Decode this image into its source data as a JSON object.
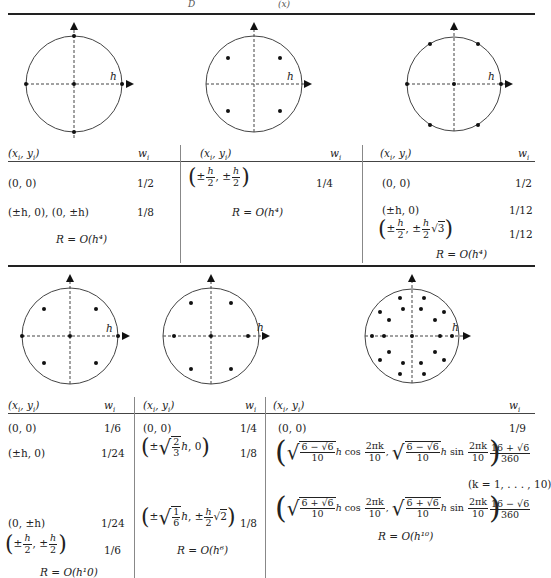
{
  "header": {
    "partial_caption": [
      "D",
      "(x)"
    ]
  },
  "labels": {
    "axis_label": "h",
    "col_xy": "(x_i, y_i)",
    "col_w": "w_i"
  },
  "top_row": {
    "panels": [
      {
        "id": "rule-5pt",
        "points": [
          [
            0,
            0
          ],
          [
            1,
            0
          ],
          [
            -1,
            0
          ],
          [
            0,
            1
          ],
          [
            0,
            -1
          ]
        ],
        "rows": [
          {
            "xy": "(0, 0)",
            "w": "1/2"
          },
          {
            "xy": "(±h, 0), (0, ±h)",
            "w": "1/8"
          }
        ],
        "error": "R = O(h⁴)"
      },
      {
        "id": "rule-4pt",
        "points": [
          [
            0.5,
            0.5
          ],
          [
            -0.5,
            0.5
          ],
          [
            0.5,
            -0.5
          ],
          [
            -0.5,
            -0.5
          ]
        ],
        "rows": [
          {
            "xy": "(±h/2, ±h/2)",
            "w": "1/4"
          }
        ],
        "error": "R = O(h⁴)"
      },
      {
        "id": "rule-7pt",
        "points": [
          [
            0,
            0
          ],
          [
            1,
            0
          ],
          [
            -1,
            0
          ],
          [
            0.5,
            0.866
          ],
          [
            -0.5,
            0.866
          ],
          [
            0.5,
            -0.866
          ],
          [
            -0.5,
            -0.866
          ]
        ],
        "rows": [
          {
            "xy": "(0, 0)",
            "w": "1/2"
          },
          {
            "xy": "(±h, 0)",
            "w": "1/12"
          },
          {
            "xy": "(±h/2, ±(h/2)√3)",
            "w": "1/12"
          }
        ],
        "error": "R = O(h⁴)"
      }
    ]
  },
  "bottom_row": {
    "panels": [
      {
        "id": "rule-9pt",
        "points": [
          [
            0,
            0
          ],
          [
            1,
            0
          ],
          [
            -1,
            0
          ],
          [
            0.55,
            0.55
          ],
          [
            -0.55,
            0.55
          ],
          [
            0.55,
            -0.55
          ],
          [
            -0.55,
            -0.55
          ]
        ],
        "rows": [
          {
            "xy": "(0, 0)",
            "w": "1/6"
          },
          {
            "xy": "(±h, 0)",
            "w": "1/24"
          },
          {
            "xy": "(0, ±h)",
            "w": "1/24"
          },
          {
            "xy": "(±h/2, ±h/2)",
            "w": "1/6"
          }
        ],
        "error": "R = O(h¹0)"
      },
      {
        "id": "rule-7pt-b",
        "points": [
          [
            0,
            0
          ],
          [
            0.816,
            0
          ],
          [
            -0.816,
            0
          ],
          [
            0.408,
            0.707
          ],
          [
            -0.408,
            0.707
          ],
          [
            0.408,
            -0.707
          ],
          [
            -0.408,
            -0.707
          ]
        ],
        "rows": [
          {
            "xy": "(±√(2/3) h, 0)",
            "w": "1/8"
          },
          {
            "xy": "(±√(1/6) h, ±(h/2)√2)",
            "w": "1/8"
          }
        ],
        "rows_first": {
          "xy": "(0, 0)",
          "w": "1/4"
        },
        "error": "R = O(h⁶)"
      },
      {
        "id": "rule-21pt",
        "points_rings": [
          0.597,
          0.894
        ],
        "ring_count": 10,
        "rows": [
          {
            "xy": "(0, 0)",
            "w": "1/9"
          },
          {
            "xy": "(√((6−√6)/10) h cos(2πk/10), √((6−√6)/10) h sin(2πk/10))",
            "w": "(16+√6)/360"
          },
          {
            "xy": "(√((6+√6)/10) h cos(2πk/10), √((6+√6)/10) h sin(2πk/10))",
            "w": "(16−√6)/360"
          }
        ],
        "k_range": "(k = 1, . . . , 10)",
        "error": "R = O(h¹⁰)"
      }
    ]
  },
  "text": {
    "zero": "(0, 0)",
    "pm_h_0": "(±h, 0)",
    "pm_h_0_0_pm_h": "(±h, 0), (0, ±h)",
    "zero_pm_h": "(0, ±h)",
    "w_1_2": "1/2",
    "w_1_8": "1/8",
    "w_1_4": "1/4",
    "w_1_12": "1/12",
    "w_1_6": "1/6",
    "w_1_24": "1/24",
    "w_1_9": "1/9",
    "err_h4": "R = O(h⁴)",
    "err_h6": "R = O(h⁶)",
    "err_h10": "R = O(h¹⁰)",
    "err_h1_0": "R = O(h¹0)",
    "k_range": "(k = 1, . . . , 10)",
    "pm": "±",
    "h": "h",
    "two": "2",
    "three": "3",
    "six": "6",
    "ten": "10",
    "one": "1",
    "comma": ",",
    "zero_tail": ", 0",
    "cos": "cos",
    "sin": "sin",
    "two_pi_k": "2πk",
    "six_minus_sqrt6": "6 − √6",
    "six_plus_sqrt6": "6 + √6",
    "sixteen_plus": "16 + √6",
    "sixteen_minus": "16 − √6",
    "three_sixty": "360",
    "lparen": "(",
    "rparen": ")",
    "sqrt": "√"
  }
}
